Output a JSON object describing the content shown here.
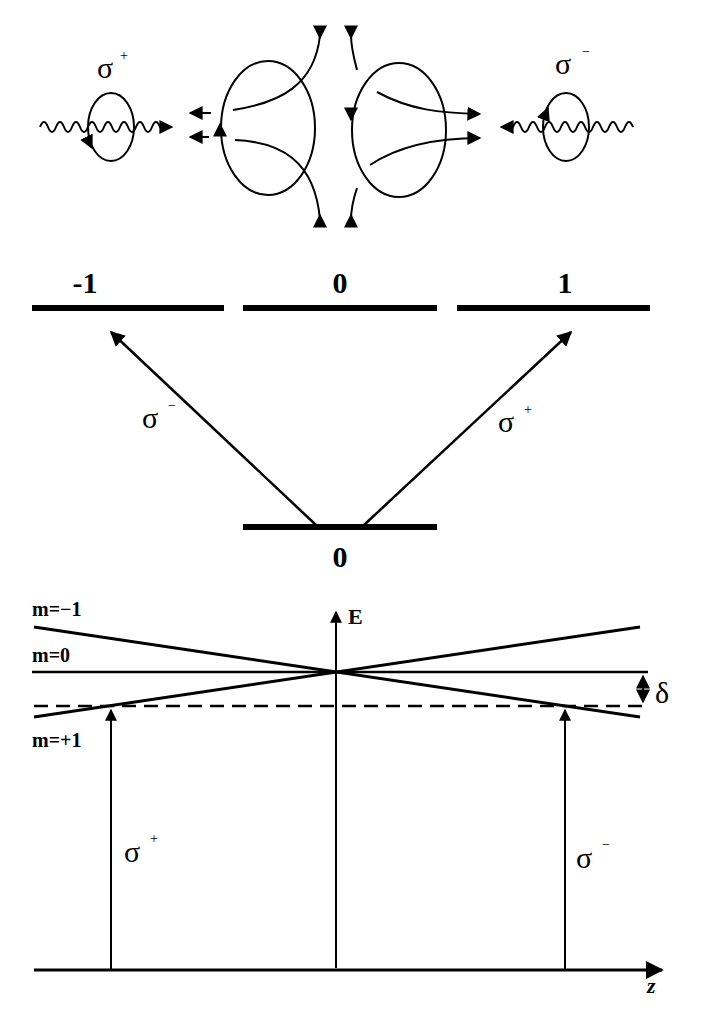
{
  "panel_top": {
    "left_beam_label": "σ",
    "left_beam_sup": "+",
    "right_beam_label": "σ",
    "right_beam_sup": "−"
  },
  "panel_middle": {
    "excited_levels": [
      {
        "label": "-1"
      },
      {
        "label": "0"
      },
      {
        "label": "1"
      }
    ],
    "ground_level": {
      "label": "0"
    },
    "transitions": [
      {
        "label": "σ",
        "sup": "−",
        "to": "-1"
      },
      {
        "label": "σ",
        "sup": "+",
        "to": "1"
      }
    ]
  },
  "panel_bottom": {
    "y_axis_label": "E",
    "x_axis_label": "z",
    "level_labels": [
      "m=−1",
      "m=0",
      "m=+1"
    ],
    "detuning_label": "δ",
    "beam_left": {
      "label": "σ",
      "sup": "+"
    },
    "beam_right": {
      "label": "σ",
      "sup": "−"
    }
  },
  "colors": {
    "ink": "#000000",
    "background": "#ffffff"
  }
}
